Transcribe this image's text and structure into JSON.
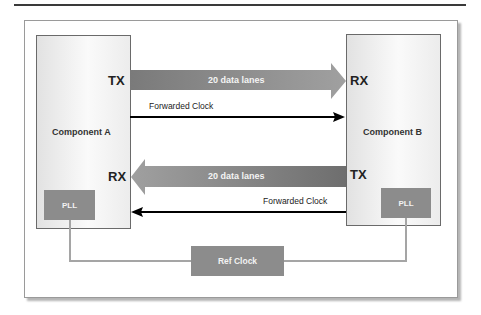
{
  "diagram": {
    "component_a": {
      "label": "Component A",
      "tx": "TX",
      "rx": "RX",
      "pll": "PLL"
    },
    "component_b": {
      "label": "Component B",
      "tx": "TX",
      "rx": "RX",
      "pll": "PLL"
    },
    "lanes_a_to_b": {
      "label": "20 data lanes"
    },
    "lanes_b_to_a": {
      "label": "20 data lanes"
    },
    "clock_a_to_b": {
      "label": "Forwarded Clock"
    },
    "clock_b_to_a": {
      "label": "Forwarded Clock"
    },
    "ref_clock": {
      "label": "Ref Clock"
    },
    "colors": {
      "arrow_fill": "#8a8a8a",
      "pll_fill": "#8c8c8c",
      "line": "#a5a5a5",
      "clock_line": "#000000"
    }
  }
}
